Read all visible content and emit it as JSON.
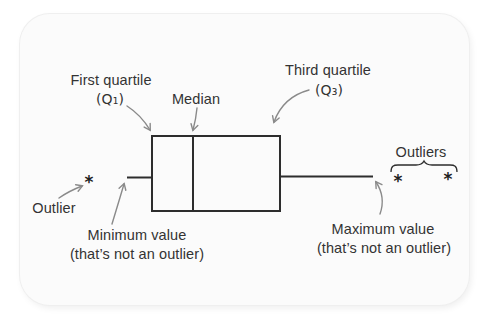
{
  "diagram": {
    "labels": {
      "first_quartile": {
        "line1": "First quartile",
        "line2": "(Q₁)"
      },
      "median": "Median",
      "third_quartile": {
        "line1": "Third quartile",
        "line2": "(Q₃)"
      },
      "outliers": "Outliers",
      "outlier": "Outlier",
      "minimum": {
        "line1": "Minimum value",
        "line2": "(that’s not an outlier)"
      },
      "maximum": {
        "line1": "Maximum value",
        "line2": "(that’s not an outlier)"
      },
      "outlier_marker": "*"
    },
    "colors": {
      "line": "#2d2d2d",
      "arrow": "#8a8a8a",
      "text": "#333333",
      "card_background": "#fbfbfb",
      "page_background": "#ffffff"
    }
  }
}
